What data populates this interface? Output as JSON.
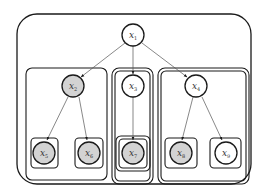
{
  "diagram": {
    "type": "graphical-model",
    "colors": {
      "observed_fill": "#d3d3d3",
      "latent_fill": "#ffffff",
      "stroke": "#1a1a1a"
    },
    "nodes": [
      {
        "id": "x1",
        "base": "x",
        "sub": "1",
        "observed": false
      },
      {
        "id": "x2",
        "base": "x",
        "sub": "2",
        "observed": true
      },
      {
        "id": "x3",
        "base": "x",
        "sub": "3",
        "observed": false
      },
      {
        "id": "x4",
        "base": "x",
        "sub": "4",
        "observed": false
      },
      {
        "id": "x5",
        "base": "x",
        "sub": "5",
        "observed": true
      },
      {
        "id": "x6",
        "base": "x",
        "sub": "6",
        "observed": true
      },
      {
        "id": "x7",
        "base": "x",
        "sub": "7",
        "observed": true
      },
      {
        "id": "x8",
        "base": "x",
        "sub": "8",
        "observed": true
      },
      {
        "id": "x9",
        "base": "x",
        "sub": "9",
        "observed": false
      }
    ],
    "edges": [
      {
        "from": "x1",
        "to": "x2"
      },
      {
        "from": "x1",
        "to": "x3"
      },
      {
        "from": "x1",
        "to": "x4"
      },
      {
        "from": "x2",
        "to": "x5"
      },
      {
        "from": "x2",
        "to": "x6"
      },
      {
        "from": "x3",
        "to": "x7"
      },
      {
        "from": "x4",
        "to": "x8"
      },
      {
        "from": "x4",
        "to": "x9"
      }
    ],
    "groups": [
      {
        "name": "outer-frame",
        "contains": [
          "x1",
          "x2",
          "x3",
          "x4",
          "x5",
          "x6",
          "x7",
          "x8",
          "x9"
        ]
      },
      {
        "name": "left-plate",
        "contains": [
          "x2",
          "x5",
          "x6"
        ],
        "border": "single"
      },
      {
        "name": "middle-plate",
        "contains": [
          "x3",
          "x7"
        ],
        "border": "double"
      },
      {
        "name": "right-plate",
        "contains": [
          "x4",
          "x8",
          "x9"
        ],
        "border": "double"
      }
    ]
  }
}
